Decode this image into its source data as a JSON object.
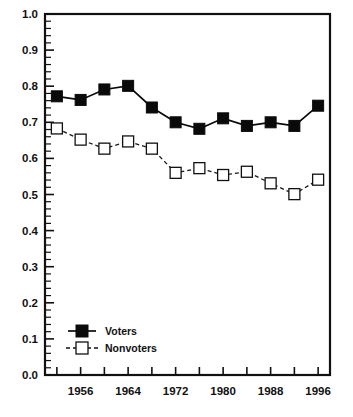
{
  "chart_data": {
    "type": "line",
    "title": "",
    "subtitle": "",
    "xlabel": "",
    "ylabel": "",
    "x": [
      1952,
      1956,
      1960,
      1964,
      1968,
      1972,
      1976,
      1980,
      1984,
      1988,
      1992,
      1996
    ],
    "xtick_labels": [
      "1956",
      "1964",
      "1972",
      "1980",
      "1988",
      "1996"
    ],
    "xtick_values": [
      1956,
      1964,
      1972,
      1980,
      1988,
      1996
    ],
    "xlim": [
      1950,
      1998
    ],
    "ytick_labels": [
      "0.0",
      "0.1",
      "0.2",
      "0.3",
      "0.4",
      "0.5",
      "0.6",
      "0.7",
      "0.8",
      "0.9",
      "1.0"
    ],
    "ytick_values": [
      0.0,
      0.1,
      0.2,
      0.3,
      0.4,
      0.5,
      0.6,
      0.7,
      0.8,
      0.9,
      1.0
    ],
    "ylim": [
      0.0,
      1.0
    ],
    "y_minor_interval": 0.02,
    "grid": false,
    "legend_position": "lower-left",
    "series": [
      {
        "name": "Voters",
        "marker": "filled-square",
        "line_style": "solid",
        "color": "#0a0a0a",
        "values": [
          0.772,
          0.762,
          0.791,
          0.801,
          0.741,
          0.7,
          0.682,
          0.711,
          0.69,
          0.7,
          0.69,
          0.746
        ]
      },
      {
        "name": "Nonvoters",
        "marker": "open-square",
        "line_style": "dashed",
        "color": "#111111",
        "values": [
          0.683,
          0.652,
          0.627,
          0.647,
          0.627,
          0.56,
          0.573,
          0.554,
          0.563,
          0.531,
          0.501,
          0.541
        ]
      }
    ]
  },
  "legend": {
    "items": [
      {
        "label": "Voters",
        "marker": "filled-square",
        "line_style": "solid"
      },
      {
        "label": "Nonvoters",
        "marker": "open-square",
        "line_style": "dashed"
      }
    ]
  },
  "axes": {
    "y_labels": [
      "1.0",
      "0.9",
      "0.8",
      "0.7",
      "0.6",
      "0.5",
      "0.4",
      "0.3",
      "0.2",
      "0.1",
      "0.0"
    ],
    "x_labels": [
      "1956",
      "1964",
      "1972",
      "1980",
      "1988",
      "1996"
    ]
  }
}
